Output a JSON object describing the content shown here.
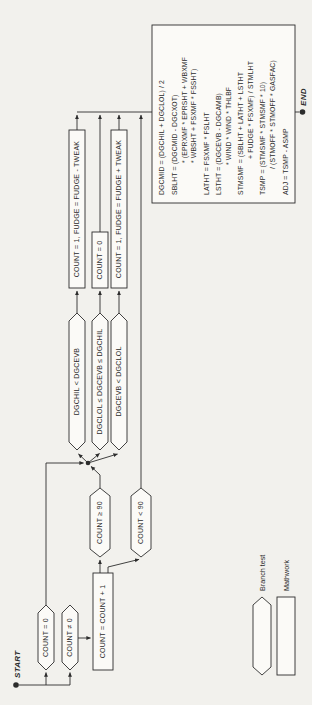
{
  "palette": {
    "paper": "#f2f1ed",
    "ink": "#2c2c2c",
    "node_fill": "#fbfaf7"
  },
  "terminals": {
    "start": "START",
    "end": "END"
  },
  "branch_tests": {
    "count_eq_zero": "COUNT = 0",
    "count_ne_zero": "COUNT ≠ 0",
    "count_ge_90": "COUNT ≥ 90",
    "count_lt_90": "COUNT < 90",
    "evb_above_high": "DGCHIL < DGCEVB",
    "evb_in_range": "DGCLOL ≤ DGCEVB ≤ DGCHIL",
    "evb_below_low": "DGCEVB < DGCLOL"
  },
  "mathwork": {
    "increment_count": "COUNT = COUNT + 1",
    "fudge_down": "COUNT = 1, FUDGE = FUDGE - TWEAK",
    "count_reset": "COUNT = 0",
    "fudge_up": "COUNT = 1, FUDGE = FUDGE + TWEAK"
  },
  "formula_box_lines": [
    "DGCMID = (DGCHIL + DGCLOL) / 2",
    "SBLHT = (DGCMID - DGCXOT)",
    "* (EPRXMF * EPRSHT + WBXMF",
    "* WBSHT + FSXMF * FSSHT)",
    "LATHT = FSXMF * FSLHT",
    "LSTHT = (DGCEVB - DGCAMB)",
    "* WIND * WIND * THLBF",
    "STMSMF = (SBLHT + LATHT + LSTHT",
    "+ FUDGE * FSXMF) / STMLHT",
    "TSMP = (STMSMF * STMSMF * 10)",
    "/ (STMOFF * STMOFF * GASFAC)",
    "ADJ = TSMP - ASMP"
  ],
  "legend": {
    "branch_test": "Branch test",
    "mathwork": "Mathwork"
  }
}
